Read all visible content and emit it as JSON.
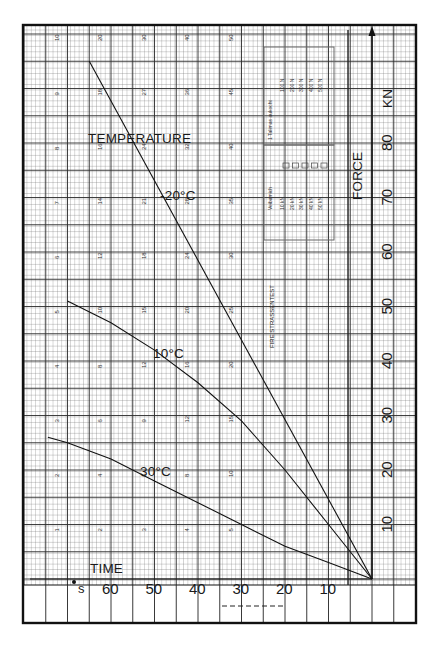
{
  "chart_data": {
    "type": "line",
    "title": "",
    "xlabel": "TIME",
    "x_unit": "s",
    "ylabel": "FORCE",
    "y_unit": "KN",
    "x_direction": "reversed (time increases to the left)",
    "xlim": [
      0,
      80
    ],
    "ylim": [
      0,
      100
    ],
    "x_ticks": [
      10,
      20,
      30,
      40,
      50,
      60
    ],
    "y_ticks": [
      10,
      20,
      30,
      40,
      50,
      60,
      70,
      80
    ],
    "grid": true,
    "legend_title": "TEMPERATURE",
    "series": [
      {
        "name": "-20°C",
        "x": [
          0,
          65
        ],
        "y": [
          0,
          95
        ]
      },
      {
        "name": "10°C",
        "x": [
          0,
          10,
          20,
          30,
          40,
          50,
          60,
          70
        ],
        "y": [
          0,
          10,
          20,
          29,
          36,
          42,
          47,
          51
        ]
      },
      {
        "name": "30°C",
        "x": [
          0,
          10,
          20,
          30,
          40,
          50,
          60,
          70,
          74.5
        ],
        "y": [
          0,
          3,
          6,
          10,
          14,
          18,
          22,
          25,
          26
        ]
      }
    ],
    "annotations": [
      "TEMPERATURE",
      "-20°C",
      "10°C",
      "30°C",
      "FIRE STRASSENTEST"
    ]
  },
  "labels": {
    "temperature": "TEMPERATURE",
    "minus20": "-20°C",
    "plus10": "10°C",
    "plus30": "30°C",
    "force": "FORCE",
    "kn": "KN",
    "time": "TIME",
    "s": "s",
    "test_label": "FIRE STRASSENTEST"
  },
  "legend_box": {
    "col_a_header": "1 Talimas aukocht",
    "col_a_values": [
      "100 N",
      "200 N",
      "300 N",
      "400 N",
      "500 N"
    ],
    "col_b_header": "Veibamich",
    "col_b_values": [
      "10 kN",
      "20 kN",
      "30 kN",
      "40 kN",
      "50 kN"
    ]
  },
  "grid_numbers": {
    "rows": [
      [
        10,
        20,
        30,
        40,
        50
      ],
      [
        9,
        18,
        27,
        36,
        45
      ],
      [
        8,
        16,
        24,
        32,
        40
      ],
      [
        7,
        14,
        21,
        28,
        35
      ],
      [
        6,
        12,
        18,
        24,
        30
      ],
      [
        5,
        10,
        15,
        20,
        25
      ],
      [
        4,
        8,
        12,
        16,
        20
      ],
      [
        3,
        6,
        9,
        12,
        15
      ],
      [
        2,
        4,
        6,
        8,
        10
      ],
      [
        1,
        2,
        3,
        4,
        5
      ]
    ]
  }
}
